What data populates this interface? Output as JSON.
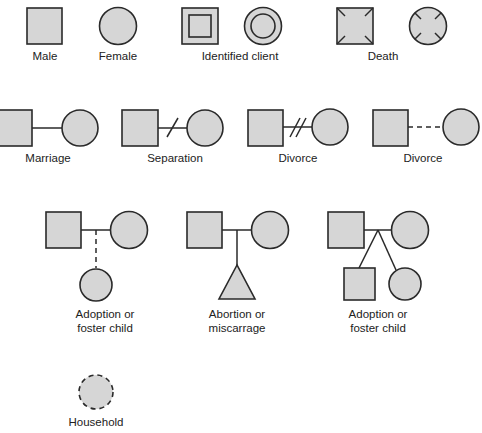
{
  "colors": {
    "fill": "#d6d6d6",
    "stroke": "#2a2a2a",
    "text": "#222222",
    "background": "#ffffff"
  },
  "row1": {
    "male": {
      "label": "Male",
      "icon": "square"
    },
    "female": {
      "label": "Female",
      "icon": "circle"
    },
    "identified_client": {
      "label": "Identified client",
      "icons": [
        "double-square",
        "double-circle"
      ]
    },
    "death": {
      "label": "Death",
      "icons": [
        "square-with-x-marks",
        "circle-with-x-marks"
      ]
    }
  },
  "row2": {
    "marriage": {
      "label": "Marriage",
      "connector": "solid line"
    },
    "separation": {
      "label": "Separation",
      "connector": "solid line with single slash"
    },
    "divorce_slashes": {
      "label": "Divorce",
      "connector": "solid line with double slash"
    },
    "divorce_dashed": {
      "label": "Divorce",
      "connector": "dashed line"
    }
  },
  "row3": {
    "adoption_dashed": {
      "label_line1": "Adoption or",
      "label_line2": "foster child",
      "child": "circle via dashed line"
    },
    "abortion": {
      "label_line1": "Abortion or",
      "label_line2": "miscarrage",
      "child": "triangle"
    },
    "adoption_branch": {
      "label_line1": "Adoption or",
      "label_line2": "foster child",
      "children": [
        "square",
        "circle"
      ]
    }
  },
  "row4": {
    "household": {
      "label": "Household",
      "icon": "dashed-circle"
    }
  }
}
